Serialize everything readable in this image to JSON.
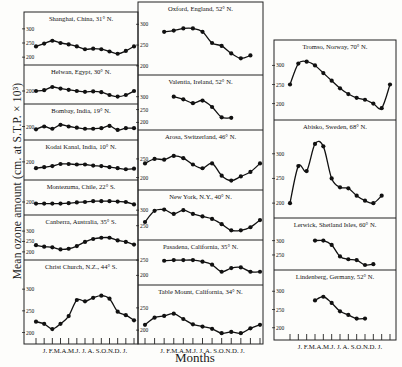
{
  "chart_data": {
    "type": "line",
    "title": "",
    "xlabel": "Months",
    "ylabel": "Mean ozone amount (cm. at S.T.P. × 10³)",
    "month_ticks": [
      "J.",
      "F.",
      "M.",
      "A.",
      "M.",
      "J.",
      "J.",
      "A.",
      "S.",
      "O.",
      "N.",
      "D.",
      "J."
    ],
    "month_tick_label": "J. F.M.A.M.J. J. A. S.O.N.D. J.",
    "grid": false,
    "legend": null,
    "panels": [
      {
        "column": 0,
        "station": "Shanghai, China, 31° N.",
        "y_ticks": [
          200,
          250,
          300
        ],
        "ylim": [
          190,
          310
        ],
        "values": [
          238,
          248,
          258,
          250,
          245,
          238,
          228,
          230,
          228,
          220,
          212,
          222,
          238
        ]
      },
      {
        "column": 0,
        "station": "Helwan, Egypt, 30° N.",
        "y_ticks": [
          200
        ],
        "ylim": [
          180,
          230
        ],
        "values": [
          200,
          202,
          210,
          206,
          203,
          200,
          198,
          199,
          197,
          190,
          186,
          190,
          200
        ]
      },
      {
        "column": 0,
        "station": "Bombay, India, 19° N.",
        "y_ticks": [
          200
        ],
        "ylim": [
          185,
          215
        ],
        "values": [
          195,
          200,
          196,
          203,
          200,
          198,
          196,
          196,
          197,
          201,
          194,
          197,
          197
        ]
      },
      {
        "column": 0,
        "station": "Kodai Kanal, India, 10° N.",
        "y_ticks": [
          200
        ],
        "ylim": [
          175,
          215
        ],
        "values": [
          188,
          190,
          192,
          196,
          196,
          195,
          195,
          193,
          192,
          190,
          188,
          186,
          187
        ]
      },
      {
        "column": 0,
        "station": "Montezuma, Chile, 22° S.",
        "y_ticks": [
          200
        ],
        "ylim": [
          180,
          220
        ],
        "values": [
          196,
          196,
          196,
          196,
          197,
          199,
          200,
          202,
          202,
          202,
          201,
          200,
          194
        ]
      },
      {
        "column": 0,
        "station": "Canberra, Australia, 35° S.",
        "y_ticks": [
          200,
          250,
          300
        ],
        "ylim": [
          185,
          310
        ],
        "values": [
          232,
          225,
          222,
          212,
          215,
          228,
          248,
          262,
          268,
          268,
          255,
          248,
          235
        ]
      },
      {
        "column": 0,
        "station": "Christ Church, N.Z., 44° S.",
        "y_ticks": [
          200,
          250,
          300
        ],
        "ylim": [
          185,
          335
        ],
        "values": [
          225,
          220,
          208,
          220,
          238,
          275,
          272,
          280,
          285,
          278,
          248,
          240,
          228
        ]
      },
      {
        "column": 1,
        "station": "Oxford, England, 52° N.",
        "y_ticks": [
          200,
          250,
          300
        ],
        "ylim": [
          190,
          320
        ],
        "values": [
          282,
          285,
          290,
          290,
          282,
          255,
          248,
          230,
          218,
          225
        ]
      },
      {
        "column": 1,
        "station": "Valentia, Ireland, 52° N.",
        "y_ticks": [
          200,
          250,
          300
        ],
        "ylim": [
          190,
          330
        ],
        "values": [
          300,
          290,
          275,
          285,
          260,
          220,
          218
        ]
      },
      {
        "column": 1,
        "station": "Arosa, Switzerland, 46° N.",
        "y_ticks": [
          200,
          250
        ],
        "ylim": [
          180,
          290
        ],
        "values": [
          238,
          250,
          248,
          258,
          252,
          235,
          225,
          238,
          205,
          192,
          203,
          215,
          238
        ]
      },
      {
        "column": 1,
        "station": "New York, N.Y., 40° N.",
        "y_ticks": [
          250,
          300
        ],
        "ylim": [
          220,
          320
        ],
        "values": [
          262,
          298,
          302,
          288,
          300,
          288,
          280,
          272,
          255,
          235,
          235,
          245,
          268
        ]
      },
      {
        "column": 1,
        "station": "Pasadena, California, 35° N.",
        "y_ticks": [
          200,
          250
        ],
        "ylim": [
          185,
          270
        ],
        "values": [
          248,
          250,
          250,
          250,
          245,
          235,
          212,
          224,
          226,
          212,
          212
        ]
      },
      {
        "column": 1,
        "station": "Table Mount, California, 34° N.",
        "y_ticks": [
          200,
          250
        ],
        "ylim": [
          180,
          270
        ],
        "values": [
          212,
          228,
          232,
          237,
          225,
          213,
          208,
          203,
          193,
          196,
          193,
          204,
          212
        ]
      },
      {
        "column": 2,
        "station": "Tromso, Norway, 70° N.",
        "y_ticks": [
          200,
          250,
          300
        ],
        "ylim": [
          170,
          330
        ],
        "values": [
          250,
          305,
          310,
          300,
          280,
          260,
          240,
          225,
          215,
          210,
          200,
          188,
          250
        ]
      },
      {
        "column": 2,
        "station": "Abisko, Sweden, 68° N.",
        "y_ticks": [
          200,
          250,
          300
        ],
        "ylim": [
          180,
          340
        ],
        "values": [
          200,
          275,
          265,
          320,
          315,
          250,
          232,
          230,
          215,
          205,
          200,
          215
        ]
      },
      {
        "column": 2,
        "station": "Lerwick, Shetland Isles, 60° N.",
        "y_ticks": [
          250,
          300
        ],
        "ylim": [
          215,
          330
        ],
        "values": [
          300,
          300,
          285,
          245,
          235,
          232,
          215,
          218
        ]
      },
      {
        "column": 2,
        "station": "Lindenberg, Germany, 52° N.",
        "y_ticks": [
          200,
          250,
          300
        ],
        "ylim": [
          180,
          320
        ],
        "values": [
          275,
          285,
          268,
          245,
          235,
          225,
          225
        ]
      }
    ]
  },
  "figure": {
    "ylabel": "Mean ozone amount (cm. at S.T.P. × 10³)",
    "xlabel": "Months"
  }
}
